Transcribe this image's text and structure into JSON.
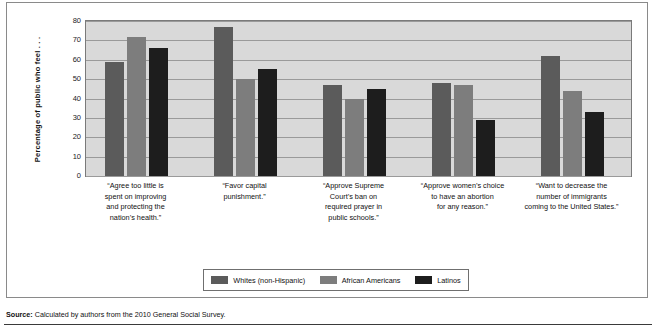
{
  "chart_data": {
    "type": "bar",
    "title": "",
    "subtitle": "",
    "xlabel": "",
    "ylabel": "Percentage of public who feel . . .",
    "ylim": [
      0,
      80
    ],
    "yticks": [
      0,
      10,
      20,
      30,
      40,
      50,
      60,
      70,
      80
    ],
    "grid": true,
    "legend_position": "bottom",
    "categories": [
      "“Agree too little is spent on improving and protecting the nation’s health.”",
      "“Favor capital punishment.”",
      "“Approve Supreme Court’s ban on required prayer in public schools.”",
      "“Approve women’s choice to have an abortion for any reason.”",
      "“Want to decrease the number of immigrants coming to the United States.”"
    ],
    "category_lines": [
      [
        "“Agree too little is",
        "spent on improving",
        "and protecting the",
        "nation’s health.”"
      ],
      [
        "“Favor capital",
        "punishment.”"
      ],
      [
        "“Approve Supreme",
        "Court’s ban on",
        "required prayer in",
        "public schools.”"
      ],
      [
        "“Approve women’s choice",
        "to have an abortion",
        "for any reason.”"
      ],
      [
        "“Want to decrease the",
        "number of immigrants",
        "coming to the United States.”"
      ]
    ],
    "series": [
      {
        "name": "Whites (non-Hispanic)",
        "color": "#5b5b5b",
        "values": [
          59,
          77,
          47,
          48,
          62
        ]
      },
      {
        "name": "African Americans",
        "color": "#7d7d7d",
        "values": [
          72,
          50,
          40,
          47,
          44
        ]
      },
      {
        "name": "Latinos",
        "color": "#1d1d1d",
        "values": [
          66,
          55,
          45,
          29,
          33
        ]
      }
    ]
  },
  "legend": {
    "items": [
      {
        "label": "Whites (non-Hispanic)",
        "color": "#5b5b5b"
      },
      {
        "label": "African Americans",
        "color": "#7d7d7d"
      },
      {
        "label": "Latinos",
        "color": "#1d1d1d"
      }
    ]
  },
  "source": {
    "prefix": "Source:",
    "text": "Calculated by authors from the 2010 General Social Survey."
  }
}
